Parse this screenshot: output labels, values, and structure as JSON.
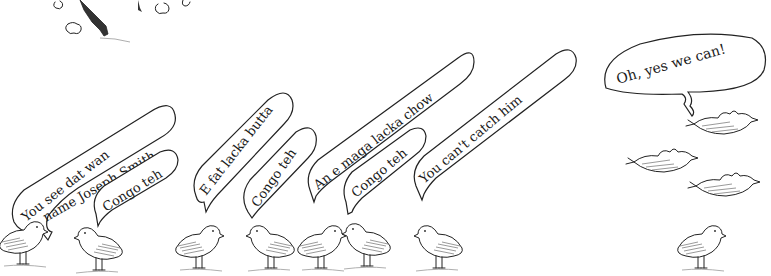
{
  "illustration": {
    "description": "Ink cartoon of small birds with speech bubbles",
    "speech_bubbles": [
      {
        "id": "b1",
        "lines": [
          "You see dat wan",
          "name Joseph Smith"
        ]
      },
      {
        "id": "b2",
        "lines": [
          "Congo teh"
        ]
      },
      {
        "id": "b3",
        "lines": [
          "E fat lacka butta"
        ]
      },
      {
        "id": "b4",
        "lines": [
          "Congo teh"
        ]
      },
      {
        "id": "b5",
        "lines": [
          "An e maga lacka chow"
        ]
      },
      {
        "id": "b6",
        "lines": [
          "Congo teh"
        ]
      },
      {
        "id": "b7",
        "lines": [
          "You can't catch him"
        ]
      },
      {
        "id": "b8",
        "lines": [
          "Oh, yes we can!"
        ]
      }
    ],
    "standing_birds_count": 7,
    "flying_birds_count": 4
  }
}
